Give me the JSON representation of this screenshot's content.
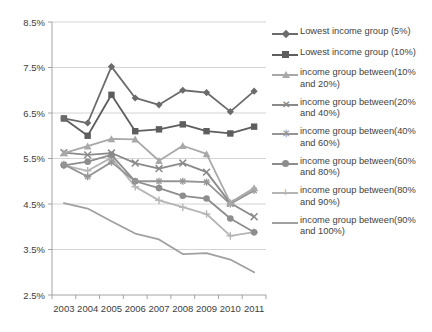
{
  "chart_data": {
    "type": "line",
    "title": "",
    "xlabel": "",
    "ylabel": "",
    "categories": [
      "2003",
      "2004",
      "2005",
      "2006",
      "2007",
      "2008",
      "2009",
      "2010",
      "2011"
    ],
    "x": [
      2003,
      2004,
      2005,
      2006,
      2007,
      2008,
      2009,
      2010,
      2011
    ],
    "ylim": [
      2.5,
      8.5
    ],
    "ytick_labels": [
      "8.5%",
      "7.5%",
      "6.5%",
      "5.5%",
      "4.5%",
      "3.5%",
      "2.5%"
    ],
    "ytick_values": [
      8.5,
      7.5,
      6.5,
      5.5,
      4.5,
      3.5,
      2.5
    ],
    "ytick_suffix": "%",
    "grid": true,
    "legend_position": "right",
    "series": [
      {
        "name": "Lowest income group (5%)",
        "marker": "diamond",
        "color": "#6b6b6b",
        "values": [
          6.38,
          6.28,
          7.52,
          6.83,
          6.68,
          7.0,
          6.95,
          6.53,
          6.98
        ]
      },
      {
        "name": "Lowest income group (10%)",
        "marker": "square",
        "color": "#5e5e5e",
        "values": [
          6.38,
          6.0,
          6.9,
          6.1,
          6.14,
          6.25,
          6.1,
          6.05,
          6.2
        ]
      },
      {
        "name": "income group between(10% and 20%)",
        "marker": "triangle",
        "color": "#a8a8a8",
        "values": [
          5.62,
          5.77,
          5.93,
          5.92,
          5.45,
          5.78,
          5.6,
          4.53,
          4.85
        ]
      },
      {
        "name": "income group between(20% and 40%)",
        "marker": "x",
        "color": "#8a8a8a",
        "values": [
          5.63,
          5.58,
          5.62,
          5.4,
          5.28,
          5.4,
          5.2,
          4.52,
          4.22
        ]
      },
      {
        "name": "income group between(40% and 60%)",
        "marker": "asterisk",
        "color": "#959595",
        "values": [
          5.37,
          5.1,
          5.42,
          5.0,
          5.0,
          5.0,
          4.98,
          4.5,
          4.8
        ]
      },
      {
        "name": "income group between(60% and 80%)",
        "marker": "circle",
        "color": "#8d8d8d",
        "values": [
          5.35,
          5.43,
          5.58,
          5.0,
          4.85,
          4.68,
          4.62,
          4.18,
          3.88
        ]
      },
      {
        "name": "income group between(80% and 90%)",
        "marker": "plus",
        "color": "#b5b5b5",
        "values": [
          5.35,
          5.23,
          5.52,
          4.88,
          4.58,
          4.43,
          4.28,
          3.8,
          3.88
        ]
      },
      {
        "name": "income group between(90% and 100%)",
        "marker": "none",
        "color": "#a0a0a0",
        "values": [
          4.52,
          4.4,
          4.12,
          3.85,
          3.72,
          3.4,
          3.42,
          3.28,
          3.0
        ]
      }
    ]
  },
  "legend": {
    "items": [
      {
        "label": "Lowest income group (5%)"
      },
      {
        "label": "Lowest income group (10%)"
      },
      {
        "label": "income group between(10% and 20%)"
      },
      {
        "label": "income group between(20% and 40%)"
      },
      {
        "label": "income group between(40% and 60%)"
      },
      {
        "label": "income group between(60% and 80%)"
      },
      {
        "label": "income group between(80% and 90%)"
      },
      {
        "label": "income group between(90% and 100%)"
      }
    ]
  }
}
